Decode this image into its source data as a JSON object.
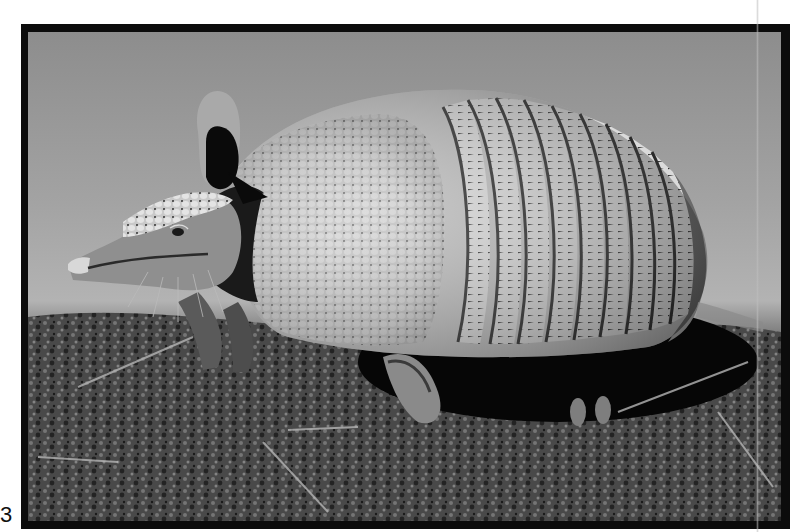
{
  "figure": {
    "number": "3",
    "colors": {
      "frame": "#0c0c0c",
      "background_sky": "#9a9a9a",
      "ground": "#4a4a4a",
      "shadow": "#060606",
      "shell_light": "#d8d8d8",
      "shell_dark": "#3a3a3a"
    },
    "shell_band_count": 9
  }
}
